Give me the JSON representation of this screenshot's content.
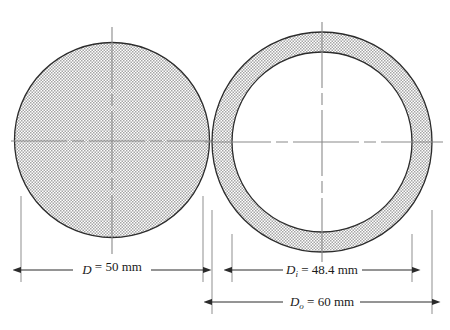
{
  "figure": {
    "kind": "engineering-cross-section-diagram",
    "background_color": "#ffffff",
    "outline_color": "#2b2b2b",
    "centerline_color": "#8a8a8a",
    "dimension_line_color": "#3a3a3a",
    "hatch_fill_color": "#9a9a9a",
    "shapes": [
      {
        "name": "solid-round-bar",
        "type": "filled-circle",
        "center_x": 112,
        "center_y": 140,
        "diameter_px": 195,
        "fill": "stipple",
        "hollow": false
      },
      {
        "name": "hollow-tube",
        "type": "annulus",
        "center_x": 322,
        "center_y": 142,
        "outer_diameter_px": 220,
        "inner_diameter_px": 180,
        "fill": "stipple",
        "hollow": true
      }
    ]
  },
  "dimensions": [
    {
      "id": "solid-diameter",
      "symbol": "D",
      "subscript": "",
      "equals": "=",
      "value": "50",
      "unit": "mm",
      "full_text": "D = 50 mm",
      "line_y": 270,
      "start_x": 21,
      "end_x": 203,
      "applies_to": "solid-round-bar"
    },
    {
      "id": "tube-inner-diameter",
      "symbol": "D",
      "subscript": "i",
      "equals": "=",
      "value": "48.4",
      "unit": "mm",
      "full_text": "Di = 48.4 mm",
      "line_y": 270,
      "start_x": 232,
      "end_x": 412,
      "applies_to": "hollow-tube"
    },
    {
      "id": "tube-outer-diameter",
      "symbol": "D",
      "subscript": "o",
      "equals": "=",
      "value": "60",
      "unit": "mm",
      "full_text": "Do = 60 mm",
      "line_y": 302,
      "start_x": 212,
      "end_x": 432,
      "applies_to": "hollow-tube"
    }
  ]
}
